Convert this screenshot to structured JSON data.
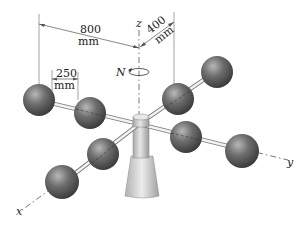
{
  "figure": {
    "type": "engineering mechanics diagram",
    "colors": {
      "sphere": "#5a5a5a",
      "sphere_highlight": "#b0b0b0",
      "rod": "#7a7a7a",
      "base": "#cfcfcf",
      "lines": "#555555"
    }
  },
  "dimensions": {
    "d800": {
      "value": "800",
      "unit": "mm"
    },
    "d400": {
      "value": "400",
      "unit": "mm"
    },
    "d250": {
      "value": "250",
      "unit": "mm"
    }
  },
  "axes": {
    "x": "x",
    "y": "y",
    "z": "z"
  },
  "rotation": {
    "label": "N"
  }
}
